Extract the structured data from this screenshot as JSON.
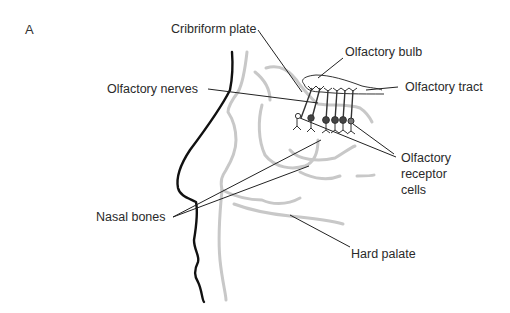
{
  "figure": {
    "panel_label": "A",
    "labels": {
      "cribriform_plate": "Cribriform plate",
      "olfactory_bulb": "Olfactory bulb",
      "olfactory_tract": "Olfactory tract",
      "olfactory_nerves": "Olfactory nerves",
      "olfactory_receptor_cells": [
        "Olfactory",
        "receptor",
        "cells"
      ],
      "nasal_bones": "Nasal bones",
      "hard_palate": "Hard palate"
    },
    "colors": {
      "outline": "#111111",
      "bone": "#c8c8c8",
      "leader": "#222222"
    }
  }
}
